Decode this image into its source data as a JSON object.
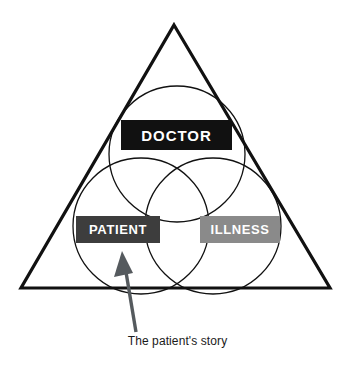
{
  "diagram": {
    "title": "The patient's story",
    "type": "venn-in-triangle",
    "shapes": {
      "triangle": {
        "name": "outer-triangle",
        "apex": [
          174,
          25
        ],
        "bottom_left": [
          21,
          288
        ],
        "bottom_right": [
          330,
          288
        ],
        "stroke": "#111111",
        "stroke_width": 3,
        "fill": "none"
      },
      "circles": [
        {
          "name": "doctor-circle",
          "cx": 177,
          "cy": 154,
          "r": 68,
          "stroke": "#111111",
          "stroke_width": 1.2,
          "fill": "none"
        },
        {
          "name": "patient-circle",
          "cx": 141,
          "cy": 226,
          "r": 68,
          "stroke": "#111111",
          "stroke_width": 1.2,
          "fill": "none"
        },
        {
          "name": "illness-circle",
          "cx": 213,
          "cy": 226,
          "r": 68,
          "stroke": "#111111",
          "stroke_width": 1.2,
          "fill": "none"
        }
      ],
      "arrow": {
        "name": "pointer-arrow",
        "color": "#555a5e",
        "tip": [
          122,
          251
        ],
        "tail": [
          137,
          332
        ]
      }
    },
    "labels": {
      "doctor": {
        "text": "DOCTOR",
        "box_color": "#111111",
        "text_color": "#ffffff"
      },
      "patient": {
        "text": "PATIENT",
        "box_color": "#3d3d3d",
        "text_color": "#ffffff"
      },
      "illness": {
        "text": "ILLNESS",
        "box_color": "#8a8a8a",
        "text_color": "#ffffff"
      }
    },
    "caption": {
      "text": "The patient's story",
      "color": "#1a1a1a"
    }
  }
}
